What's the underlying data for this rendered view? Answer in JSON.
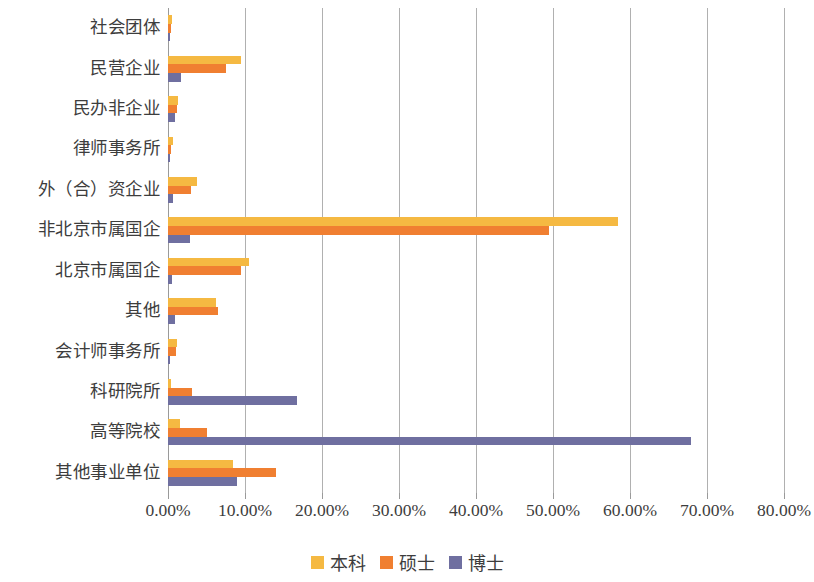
{
  "chart_data": {
    "type": "bar",
    "orientation": "horizontal",
    "title": "",
    "subtitle": "",
    "xlabel": "",
    "ylabel": "",
    "xlim": [
      0,
      80
    ],
    "x_ticks": [
      "0.00%",
      "10.00%",
      "20.00%",
      "30.00%",
      "40.00%",
      "50.00%",
      "60.00%",
      "70.00%",
      "80.00%"
    ],
    "x_tick_values": [
      0,
      10,
      20,
      30,
      40,
      50,
      60,
      70,
      80
    ],
    "grid": "vertical",
    "legend_position": "bottom-center",
    "categories": [
      "社会团体",
      "民营企业",
      "民办非企业",
      "律师事务所",
      "外（合）资企业",
      "非北京市属国企",
      "北京市属国企",
      "其他",
      "会计师事务所",
      "科研院所",
      "高等院校",
      "其他事业单位"
    ],
    "series": [
      {
        "name": "本科",
        "color": "#f5b942",
        "values": [
          0.5,
          9.5,
          1.3,
          0.7,
          3.8,
          58.5,
          10.5,
          6.2,
          1.2,
          0.4,
          1.5,
          8.5
        ]
      },
      {
        "name": "硕士",
        "color": "#f07f31",
        "values": [
          0.4,
          7.5,
          1.2,
          0.4,
          3.0,
          49.5,
          9.5,
          6.5,
          1.0,
          3.1,
          5.0,
          14.0
        ]
      },
      {
        "name": "博士",
        "color": "#6f6fa0",
        "values": [
          0.2,
          1.7,
          0.9,
          0.1,
          0.6,
          2.8,
          0.5,
          0.9,
          0.1,
          16.8,
          67.9,
          9.0
        ]
      }
    ]
  },
  "legend": {
    "items": [
      {
        "label": "本科",
        "color": "#f5b942",
        "icon": "legend-swatch-square"
      },
      {
        "label": "硕士",
        "color": "#f07f31",
        "icon": "legend-swatch-square"
      },
      {
        "label": "博士",
        "color": "#6f6fa0",
        "icon": "legend-swatch-square"
      }
    ]
  }
}
